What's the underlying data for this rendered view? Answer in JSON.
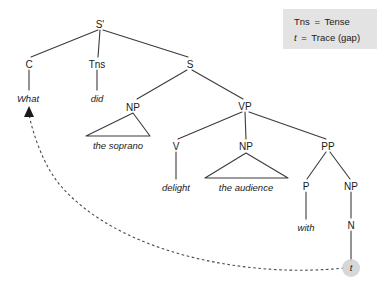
{
  "diagram": {
    "type": "constituency-tree"
  },
  "nodes": {
    "s_bar": {
      "label": "S'",
      "x": 100,
      "y": 25
    },
    "c": {
      "label": "C",
      "x": 29,
      "y": 65
    },
    "tns": {
      "label": "Tns",
      "x": 97,
      "y": 65
    },
    "s": {
      "label": "S",
      "x": 190,
      "y": 65
    },
    "np_subject": {
      "label": "NP",
      "x": 133,
      "y": 108
    },
    "vp": {
      "label": "VP",
      "x": 245,
      "y": 107
    },
    "v": {
      "label": "V",
      "x": 176,
      "y": 147
    },
    "np_object": {
      "label": "NP",
      "x": 246,
      "y": 147
    },
    "pp": {
      "label": "PP",
      "x": 328,
      "y": 147
    },
    "p": {
      "label": "P",
      "x": 306,
      "y": 187
    },
    "np_oblique": {
      "label": "NP",
      "x": 351,
      "y": 187
    },
    "n": {
      "label": "N",
      "x": 351,
      "y": 226
    }
  },
  "leaves": {
    "what": {
      "label": "What",
      "x": 28,
      "y": 99
    },
    "did": {
      "label": "did",
      "x": 97,
      "y": 99
    },
    "the_soprano": {
      "label": "the soprano",
      "x": 118,
      "y": 146
    },
    "delight": {
      "label": "delight",
      "x": 176,
      "y": 188
    },
    "the_audience": {
      "label": "the audience",
      "x": 246,
      "y": 188
    },
    "with": {
      "label": "with",
      "x": 306,
      "y": 228
    },
    "trace": {
      "label": "t",
      "x": 351,
      "y": 271
    }
  },
  "legend": {
    "line1_term": "Tns",
    "line1_eq": "=",
    "line1_def": "Tense",
    "line2_term": "t",
    "line2_eq": "=",
    "line2_def": "Trace (gap)",
    "background_color": "#e3e3e3"
  },
  "colors": {
    "branch": "#3b3b3b",
    "text": "#1a1a1a",
    "arc": "#4a4a4a",
    "trace_halo": "#d0d0d0",
    "background": "#ffffff"
  },
  "movement": {
    "description": "wh-movement arc from trace to What",
    "from": "trace",
    "to": "what",
    "style": "dashed-arrow"
  }
}
